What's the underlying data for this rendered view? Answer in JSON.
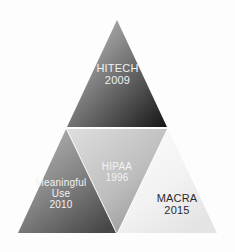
{
  "diagram": {
    "background_color": "#fdfdfd",
    "divider_color": "#ffffff",
    "segments": [
      {
        "id": "hitech",
        "name": "HITECH",
        "year": "2009",
        "position": "top",
        "text_color": "#f2f2f2",
        "fill_start": "#b9b9b9",
        "fill_end": "#1a1a1a"
      },
      {
        "id": "hipaa",
        "name": "HIPAA",
        "year": "1996",
        "position": "center",
        "text_color": "#f2f2f2",
        "fill_start": "#d8d8d8",
        "fill_end": "#9a9a9a"
      },
      {
        "id": "meaningful-use",
        "name": "Meaningful Use",
        "name_line_1": "Meaningful",
        "name_line_2": "Use",
        "year": "2010",
        "position": "bottom-left",
        "text_color": "#f2f2f2",
        "fill_start": "#a8a8a8",
        "fill_end": "#4a4a4a"
      },
      {
        "id": "macra",
        "name": "MACRA",
        "year": "2015",
        "position": "bottom-right",
        "text_color": "#2b2b2b",
        "fill_start": "#fbfbfb",
        "fill_end": "#e8e8e8"
      }
    ]
  }
}
